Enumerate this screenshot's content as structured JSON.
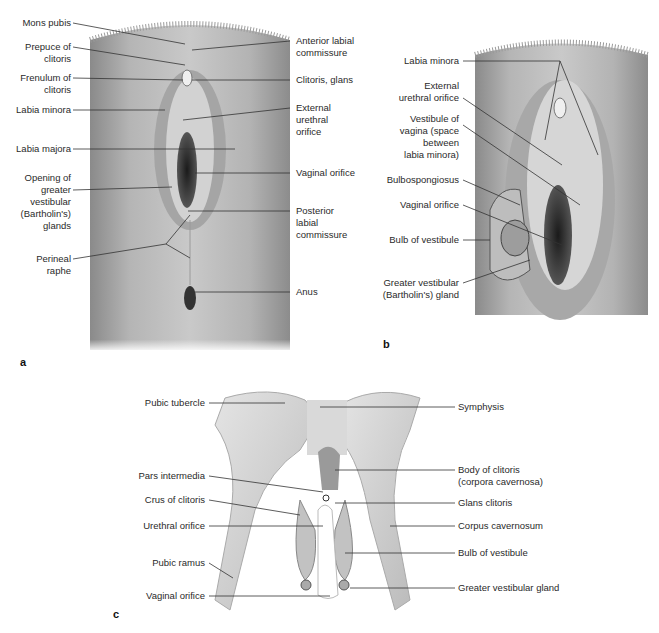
{
  "figure": {
    "panels": [
      {
        "id": "a",
        "letter": "a",
        "labels_left": [
          "Mons pubis",
          "Prepuce of\nclitoris",
          "Frenulum of\nclitoris",
          "Labia minora",
          "Labia majora",
          "Opening of\ngreater\nvestibular\n(Bartholin's)\nglands",
          "Perineal\nraphe"
        ],
        "labels_right": [
          "Anterior labial\ncommissure",
          "Clitoris, glans",
          "External\nurethral\norifice",
          "Vaginal orifice",
          "Posterior\nlabial\ncommissure",
          "Anus"
        ]
      },
      {
        "id": "b",
        "letter": "b",
        "labels_left": [
          "Labia minora",
          "External\nurethral orifice",
          "Vestibule of\nvagina (space\nbetween\nlabia minora)",
          "Bulbospongiosus",
          "Vaginal orifice",
          "Bulb of vestibule",
          "Greater vestibular\n(Bartholin's) gland"
        ]
      },
      {
        "id": "c",
        "letter": "c",
        "labels_left": [
          "Pubic tubercle",
          "Pars intermedia",
          "Crus of clitoris",
          "Urethral orifice",
          "Pubic ramus",
          "Vaginal orifice"
        ],
        "labels_right": [
          "Symphysis",
          "Body of clitoris\n(corpora cavernosa)",
          "Glans clitoris",
          "Corpus cavernosum",
          "Bulb of vestibule",
          "Greater vestibular gland"
        ]
      }
    ]
  }
}
